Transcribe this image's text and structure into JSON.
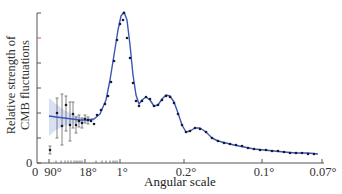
{
  "chart_data": {
    "type": "line",
    "title": "",
    "xlabel": "Angular scale",
    "ylabel": "Relative strength of CMB fluctuations",
    "ylabel_lines": [
      "Relative strength of",
      "CMB fluctuations"
    ],
    "x_scale": "log (multipole), labeled by angular scale",
    "x_ticks": [
      {
        "label": "90°",
        "px": 49
      },
      {
        "label": "18°",
        "px": 85
      },
      {
        "label": "1°",
        "px": 120
      },
      {
        "label": "0.2°",
        "px": 184
      },
      {
        "label": "0.1°",
        "px": 262
      },
      {
        "label": "0.07°",
        "px": 322
      }
    ],
    "y_ticks": [
      0,
      1,
      2,
      3,
      4,
      5,
      6
    ],
    "y_tick_labels": [
      "0"
    ],
    "x_origin_label": "0",
    "highlighted_y_tick": {
      "index": 5,
      "color": "#d9534f"
    },
    "ylim": [
      0,
      6
    ],
    "grid": false,
    "legend": null,
    "series": [
      {
        "name": "Best-fit model",
        "kind": "line",
        "color": "#3a56b8",
        "points": [
          [
            49,
            116
          ],
          [
            56,
            117
          ],
          [
            64,
            118
          ],
          [
            72,
            119
          ],
          [
            80,
            120
          ],
          [
            88,
            120
          ],
          [
            94,
            119
          ],
          [
            100,
            114
          ],
          [
            106,
            100
          ],
          [
            110,
            80
          ],
          [
            114,
            55
          ],
          [
            118,
            30
          ],
          [
            121,
            16
          ],
          [
            124,
            12
          ],
          [
            127,
            20
          ],
          [
            130,
            45
          ],
          [
            133,
            75
          ],
          [
            136,
            95
          ],
          [
            139,
            104
          ],
          [
            142,
            100
          ],
          [
            146,
            97
          ],
          [
            150,
            100
          ],
          [
            154,
            106
          ],
          [
            158,
            105
          ],
          [
            162,
            99
          ],
          [
            166,
            95
          ],
          [
            170,
            96
          ],
          [
            174,
            102
          ],
          [
            178,
            113
          ],
          [
            182,
            125
          ],
          [
            186,
            132
          ],
          [
            190,
            131
          ],
          [
            195,
            128
          ],
          [
            200,
            128
          ],
          [
            206,
            132
          ],
          [
            212,
            138
          ],
          [
            218,
            141
          ],
          [
            226,
            143
          ],
          [
            234,
            145
          ],
          [
            244,
            147
          ],
          [
            254,
            149
          ],
          [
            264,
            150
          ],
          [
            274,
            151
          ],
          [
            284,
            152
          ],
          [
            296,
            153
          ],
          [
            308,
            153
          ],
          [
            318,
            154
          ]
        ]
      },
      {
        "name": "Measured data (Planck)",
        "kind": "scatter_with_errorbars",
        "color": "#1a1a2e",
        "points": [
          {
            "x": 50,
            "y": 150,
            "err_lo": 154,
            "err_hi": 146
          },
          {
            "x": 57,
            "y": 113,
            "err_lo": 138,
            "err_hi": 98
          },
          {
            "x": 62,
            "y": 126,
            "err_lo": 145,
            "err_hi": 94
          },
          {
            "x": 66,
            "y": 105,
            "err_lo": 131,
            "err_hi": 96
          },
          {
            "x": 70,
            "y": 125,
            "err_lo": 141,
            "err_hi": 102
          },
          {
            "x": 73,
            "y": 114,
            "err_lo": 128,
            "err_hi": 102
          },
          {
            "x": 76,
            "y": 125,
            "err_lo": 133,
            "err_hi": 117
          },
          {
            "x": 79,
            "y": 121,
            "err_lo": 127,
            "err_hi": 115
          },
          {
            "x": 82,
            "y": 123,
            "err_lo": 128,
            "err_hi": 118
          },
          {
            "x": 85,
            "y": 119,
            "err_lo": 123,
            "err_hi": 115
          },
          {
            "x": 88,
            "y": 120,
            "err_lo": 124,
            "err_hi": 117
          },
          {
            "x": 91,
            "y": 121,
            "err_lo": 124,
            "err_hi": 118
          },
          {
            "x": 94,
            "y": 124,
            "err_lo": 127,
            "err_hi": 121
          },
          {
            "x": 97,
            "y": 115,
            "err_lo": 118,
            "err_hi": 112
          },
          {
            "x": 101,
            "y": 110,
            "err_lo": 113,
            "err_hi": 107
          },
          {
            "x": 105,
            "y": 104,
            "err_lo": 107,
            "err_hi": 101
          },
          {
            "x": 108,
            "y": 96,
            "err_lo": 99,
            "err_hi": 93
          },
          {
            "x": 111,
            "y": 82,
            "err_lo": 85,
            "err_hi": 79
          },
          {
            "x": 114,
            "y": 61,
            "err_lo": 64,
            "err_hi": 58
          },
          {
            "x": 117,
            "y": 40,
            "err_lo": 43,
            "err_hi": 37
          },
          {
            "x": 120,
            "y": 24,
            "err_lo": 27,
            "err_hi": 21
          },
          {
            "x": 123,
            "y": 20,
            "err_lo": 23,
            "err_hi": 17
          },
          {
            "x": 124,
            "y": 13,
            "err_lo": 16,
            "err_hi": 10
          },
          {
            "x": 127,
            "y": 38,
            "err_lo": 41,
            "err_hi": 35
          },
          {
            "x": 130,
            "y": 58,
            "err_lo": 61,
            "err_hi": 55
          },
          {
            "x": 133,
            "y": 83,
            "err_lo": 86,
            "err_hi": 80
          },
          {
            "x": 136,
            "y": 101,
            "err_lo": 104,
            "err_hi": 98
          },
          {
            "x": 139,
            "y": 106,
            "err_lo": 108,
            "err_hi": 104
          },
          {
            "x": 142,
            "y": 101,
            "err_lo": 103,
            "err_hi": 99
          },
          {
            "x": 146,
            "y": 97,
            "err_lo": 99,
            "err_hi": 95
          },
          {
            "x": 150,
            "y": 99,
            "err_lo": 101,
            "err_hi": 97
          },
          {
            "x": 154,
            "y": 106,
            "err_lo": 108,
            "err_hi": 104
          },
          {
            "x": 158,
            "y": 105,
            "err_lo": 107,
            "err_hi": 103
          },
          {
            "x": 162,
            "y": 100,
            "err_lo": 102,
            "err_hi": 98
          },
          {
            "x": 166,
            "y": 96,
            "err_lo": 98,
            "err_hi": 94
          },
          {
            "x": 170,
            "y": 97,
            "err_lo": 99,
            "err_hi": 95
          },
          {
            "x": 174,
            "y": 103,
            "err_lo": 105,
            "err_hi": 101
          },
          {
            "x": 178,
            "y": 114,
            "err_lo": 116,
            "err_hi": 112
          },
          {
            "x": 182,
            "y": 125,
            "err_lo": 127,
            "err_hi": 123
          },
          {
            "x": 186,
            "y": 132,
            "err_lo": 134,
            "err_hi": 130
          },
          {
            "x": 190,
            "y": 131,
            "err_lo": 133,
            "err_hi": 129
          },
          {
            "x": 195,
            "y": 128,
            "err_lo": 130,
            "err_hi": 126
          },
          {
            "x": 200,
            "y": 129,
            "err_lo": 131,
            "err_hi": 127
          },
          {
            "x": 206,
            "y": 132,
            "err_lo": 134,
            "err_hi": 130
          },
          {
            "x": 212,
            "y": 138,
            "err_lo": 140,
            "err_hi": 136
          },
          {
            "x": 218,
            "y": 141,
            "err_lo": 143,
            "err_hi": 139
          },
          {
            "x": 224,
            "y": 143,
            "err_lo": 145,
            "err_hi": 141
          },
          {
            "x": 230,
            "y": 144,
            "err_lo": 146,
            "err_hi": 142
          },
          {
            "x": 236,
            "y": 145,
            "err_lo": 147,
            "err_hi": 143
          },
          {
            "x": 242,
            "y": 146,
            "err_lo": 148,
            "err_hi": 144
          },
          {
            "x": 248,
            "y": 148,
            "err_lo": 150,
            "err_hi": 146
          },
          {
            "x": 254,
            "y": 149,
            "err_lo": 151,
            "err_hi": 147
          },
          {
            "x": 260,
            "y": 150,
            "err_lo": 152,
            "err_hi": 148
          },
          {
            "x": 266,
            "y": 150,
            "err_lo": 152,
            "err_hi": 148
          },
          {
            "x": 272,
            "y": 151,
            "err_lo": 153,
            "err_hi": 149
          },
          {
            "x": 278,
            "y": 151,
            "err_lo": 153,
            "err_hi": 149
          },
          {
            "x": 284,
            "y": 152,
            "err_lo": 154,
            "err_hi": 150
          },
          {
            "x": 290,
            "y": 153,
            "err_lo": 155,
            "err_hi": 151
          },
          {
            "x": 296,
            "y": 153,
            "err_lo": 155,
            "err_hi": 151
          },
          {
            "x": 302,
            "y": 153,
            "err_lo": 155,
            "err_hi": 151
          },
          {
            "x": 308,
            "y": 154,
            "err_lo": 156,
            "err_hi": 152
          },
          {
            "x": 314,
            "y": 154,
            "err_lo": 156,
            "err_hi": 152
          }
        ]
      }
    ],
    "uncertainty_band": {
      "name": "Cosmic variance band",
      "color": "#c9d3f0",
      "upper": [
        [
          49,
          98
        ],
        [
          56,
          104
        ],
        [
          64,
          110
        ],
        [
          72,
          114
        ],
        [
          80,
          117
        ],
        [
          88,
          118
        ],
        [
          94,
          118
        ]
      ],
      "lower": [
        [
          94,
          121
        ],
        [
          88,
          122
        ],
        [
          80,
          123
        ],
        [
          72,
          124
        ],
        [
          64,
          126
        ],
        [
          56,
          130
        ],
        [
          49,
          136
        ]
      ]
    }
  }
}
